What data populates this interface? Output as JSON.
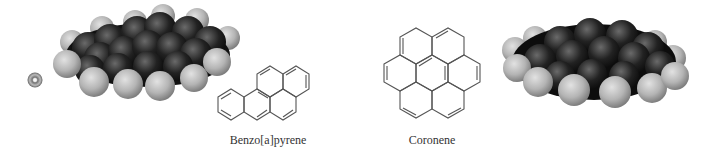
{
  "figure": {
    "molecules": [
      {
        "name": "Benzo[a]pyrene",
        "representation": "skeletal-structure",
        "rings": 5
      },
      {
        "name": "Coronene",
        "representation": "skeletal-structure",
        "rings": 7
      }
    ],
    "models": [
      {
        "name": "benzo-a-pyrene-space-filling-model",
        "for": "Benzo[a]pyrene",
        "position": "left"
      },
      {
        "name": "coronene-space-filling-model",
        "for": "Coronene",
        "position": "right"
      }
    ],
    "colors": {
      "carbon": "#1a1a1a",
      "hydrogen": "#b8b8b8",
      "bond_line": "#555555",
      "label": "#333333"
    }
  },
  "labels": {
    "benzo": "Benzo[a]pyrene",
    "coronene": "Coronene"
  }
}
